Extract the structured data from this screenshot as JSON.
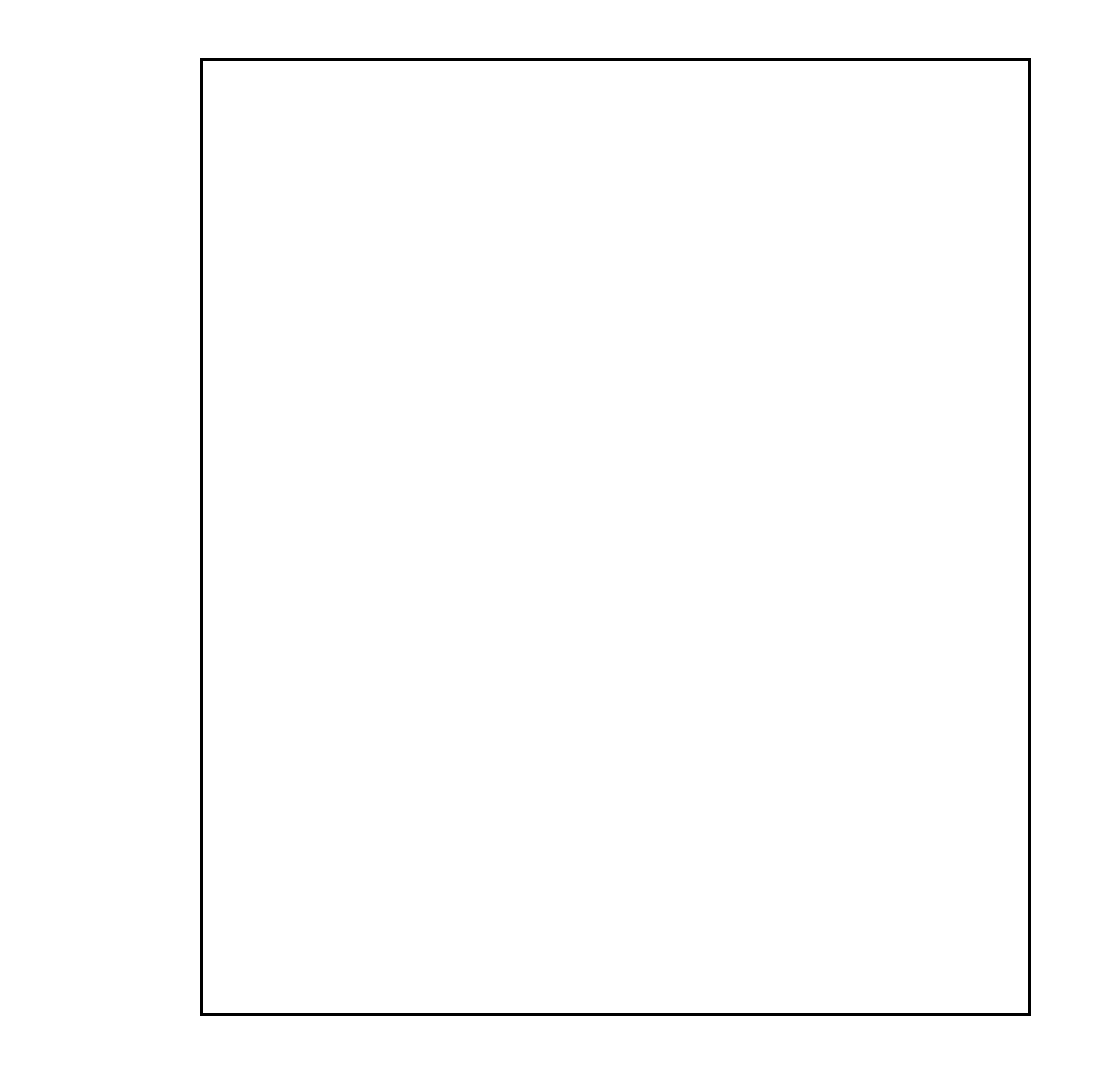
{
  "chart_data": {
    "type": "scatter",
    "title": "",
    "subtitle": "",
    "xlabel": "",
    "ylabel": "",
    "plot_kind": "normal-probability-plot",
    "xlim": [
      -0.3808,
      0.5
    ],
    "xticks": [
      "-0.30",
      "-0.20",
      "-0.10",
      "0.0",
      "0.10",
      "0.20",
      "0.30",
      "0.40",
      "0.50"
    ],
    "xtick_values": [
      -0.3,
      -0.2,
      -0.1,
      0.0,
      0.1,
      0.2,
      0.3,
      0.4,
      0.5
    ],
    "yticks": [
      "99.99",
      "99.9",
      "99.8",
      "99",
      "98",
      "95",
      "90",
      "80",
      "70",
      "60",
      "50",
      "40",
      "30",
      "20",
      "10",
      "5",
      "2",
      "1"
    ],
    "ytick_values": [
      99.99,
      99.9,
      99.8,
      99,
      98,
      95,
      90,
      80,
      70,
      60,
      50,
      40,
      30,
      20,
      10,
      5,
      2,
      1
    ],
    "grid": true,
    "legend": "none",
    "points": [
      {
        "x": -0.238,
        "y": 3.6,
        "label": ""
      },
      {
        "x": -0.172,
        "y": 10.8,
        "label": ""
      },
      {
        "x": -0.16,
        "y": 17.5,
        "label": ""
      },
      {
        "x": -0.152,
        "y": 23.5,
        "label": ""
      },
      {
        "x": -0.098,
        "y": 30.2,
        "label": ""
      },
      {
        "x": 0.0,
        "y": 36.8,
        "label": ""
      },
      {
        "x": 0.018,
        "y": 43.3,
        "label": ""
      },
      {
        "x": 0.038,
        "y": 50.0,
        "label": ""
      },
      {
        "x": 0.046,
        "y": 53.5,
        "label": ""
      },
      {
        "x": 0.06,
        "y": 59.5,
        "label": ""
      },
      {
        "x": 0.064,
        "y": 63.5,
        "label": ""
      },
      {
        "x": 0.1,
        "y": 70.0,
        "label": ""
      },
      {
        "x": 0.248,
        "y": 90.5,
        "label": ""
      },
      {
        "x": 0.41,
        "y": 95.5,
        "label": "B"
      }
    ],
    "fit_line": {
      "x0": -0.303,
      "y0": 1.45,
      "x1": 0.357,
      "y1": 97.8
    },
    "annotations": [
      {
        "text": "B",
        "x": 0.4185,
        "y": 97.0
      }
    ],
    "aux_scales": [
      {
        "name": "scale-for-15-effects",
        "title": "SCALE\nFOR\n15\nEFFECTS",
        "ticks": [
          15,
          14,
          13,
          12,
          11,
          10,
          9,
          8,
          7,
          6,
          5,
          4,
          3,
          2,
          1
        ]
      },
      {
        "name": "scale-for-7-effects",
        "title": "SCALE\nFOR\n7\nEFFECTS",
        "ticks": [
          7,
          6,
          5,
          4,
          3,
          2,
          1
        ]
      }
    ]
  }
}
